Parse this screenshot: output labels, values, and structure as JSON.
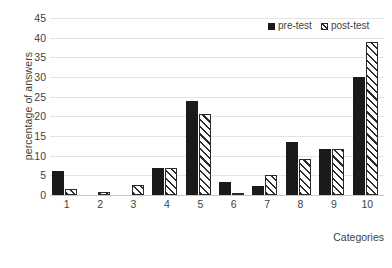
{
  "chart_data": {
    "type": "bar",
    "title": "",
    "xlabel": "Categories",
    "ylabel": "percentage of answers",
    "categories": [
      "1",
      "2",
      "3",
      "4",
      "5",
      "6",
      "7",
      "8",
      "9",
      "10"
    ],
    "series": [
      {
        "name": "pre-test",
        "style": "solid-black",
        "color": "#1a1a1a",
        "values": [
          6,
          0,
          0,
          6.8,
          24,
          3.2,
          2.3,
          13.5,
          11.8,
          30
        ]
      },
      {
        "name": "post-test",
        "style": "diagonal-hatch",
        "color": "#2b2b2b",
        "values": [
          1.5,
          0.7,
          2.5,
          6.8,
          20.7,
          0.5,
          5,
          9.2,
          11.8,
          38.8
        ]
      }
    ],
    "ylim": [
      0,
      45
    ],
    "yticks": [
      0,
      5,
      10,
      15,
      20,
      25,
      30,
      35,
      40,
      45
    ],
    "ytick_labels": [
      "0",
      "5",
      "10",
      "15",
      "20",
      "25",
      "30",
      "35",
      "40",
      "45"
    ],
    "grid": true,
    "grid_axis": "y",
    "legend_position": "top-right",
    "legend": [
      "pre-test",
      "post-test"
    ],
    "background_color": "#ffffff",
    "gridline_color": "#e4e4e4"
  }
}
